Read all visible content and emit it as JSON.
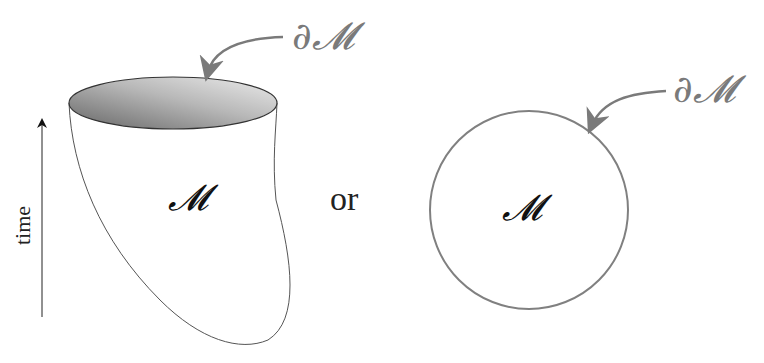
{
  "figure": {
    "left_panel": {
      "description": "spacetime region bounded in time",
      "boundary_label": "∂𝓜",
      "manifold_label": "𝓜",
      "axis_label": "time"
    },
    "connector_label": "or",
    "right_panel": {
      "description": "closed region (disk)",
      "boundary_label": "∂𝓜",
      "manifold_label": "𝓜"
    },
    "colors": {
      "boundary_arrow": "#7a7a7a",
      "outline": "#555555",
      "circle_stroke": "#808080",
      "cap_fill_dark": "#6e6e6e",
      "cap_fill_light": "#e6e6e6"
    }
  }
}
